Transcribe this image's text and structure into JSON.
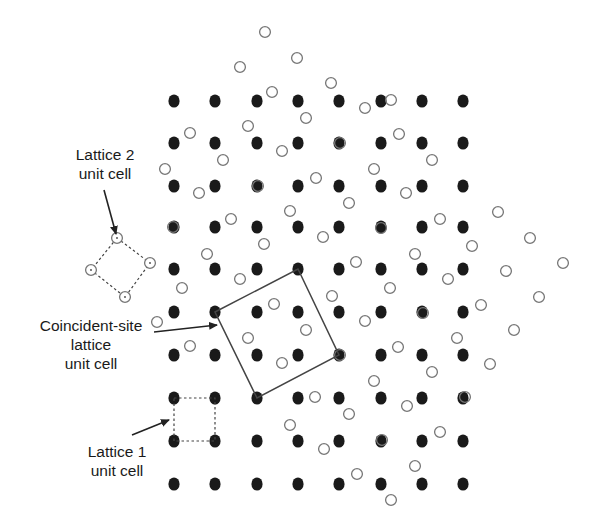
{
  "figure": {
    "labels": {
      "lattice2": {
        "line1": "Lattice 2",
        "line2": "unit cell"
      },
      "csl": {
        "line1": "Coincident-site",
        "line2": "lattice",
        "line3": "unit cell"
      },
      "lattice1": {
        "line1": "Lattice 1",
        "line2": "unit cell"
      }
    },
    "colors": {
      "lattice1_fill": "#1a1a1a",
      "lattice2_stroke": "#777777",
      "lines": "#444444"
    },
    "lattice1": {
      "marker": "filled-circle",
      "columns_x": [
        174,
        215,
        257,
        298,
        339,
        381,
        422,
        463
      ],
      "rows_y": [
        101,
        143,
        186,
        227,
        269,
        312,
        355,
        398,
        441,
        484
      ]
    },
    "lattice2": {
      "marker": "open-circle",
      "points": [
        [
          265,
          32
        ],
        [
          240,
          67
        ],
        [
          297,
          58
        ],
        [
          331,
          83
        ],
        [
          272,
          92
        ],
        [
          365,
          108
        ],
        [
          391,
          100
        ],
        [
          190,
          133
        ],
        [
          248,
          126
        ],
        [
          306,
          118
        ],
        [
          165,
          169
        ],
        [
          223,
          160
        ],
        [
          282,
          151
        ],
        [
          340,
          143
        ],
        [
          399,
          134
        ],
        [
          199,
          193
        ],
        [
          258,
          186
        ],
        [
          316,
          178
        ],
        [
          374,
          169
        ],
        [
          432,
          160
        ],
        [
          173,
          227
        ],
        [
          231,
          219
        ],
        [
          290,
          211
        ],
        [
          349,
          203
        ],
        [
          406,
          193
        ],
        [
          498,
          212
        ],
        [
          207,
          254
        ],
        [
          264,
          244
        ],
        [
          323,
          237
        ],
        [
          381,
          228
        ],
        [
          440,
          219
        ],
        [
          530,
          238
        ],
        [
          182,
          288
        ],
        [
          240,
          279
        ],
        [
          356,
          262
        ],
        [
          415,
          254
        ],
        [
          472,
          246
        ],
        [
          563,
          263
        ],
        [
          157,
          322
        ],
        [
          274,
          304
        ],
        [
          332,
          296
        ],
        [
          390,
          288
        ],
        [
          448,
          279
        ],
        [
          506,
          271
        ],
        [
          539,
          297
        ],
        [
          190,
          346
        ],
        [
          248,
          338
        ],
        [
          306,
          330
        ],
        [
          365,
          321
        ],
        [
          423,
          313
        ],
        [
          481,
          305
        ],
        [
          514,
          330
        ],
        [
          282,
          363
        ],
        [
          340,
          355
        ],
        [
          398,
          347
        ],
        [
          457,
          338
        ],
        [
          290,
          425
        ],
        [
          315,
          397
        ],
        [
          374,
          381
        ],
        [
          432,
          372
        ],
        [
          490,
          364
        ],
        [
          349,
          414
        ],
        [
          407,
          406
        ],
        [
          465,
          397
        ],
        [
          324,
          449
        ],
        [
          382,
          440
        ],
        [
          440,
          432
        ],
        [
          357,
          474
        ],
        [
          415,
          466
        ],
        [
          391,
          500
        ]
      ]
    },
    "lattice2_unit_cell": [
      [
        117,
        238
      ],
      [
        150,
        263
      ],
      [
        125,
        297
      ],
      [
        91,
        270
      ]
    ],
    "lattice1_unit_cell": [
      [
        174,
        398
      ],
      [
        215,
        398
      ],
      [
        215,
        441
      ],
      [
        174,
        441
      ]
    ],
    "csl_unit_cell": [
      [
        215,
        312
      ],
      [
        298,
        269
      ],
      [
        339,
        355
      ],
      [
        257,
        398
      ]
    ],
    "arrows": {
      "lattice2": {
        "from": [
          104,
          190
        ],
        "to": [
          116,
          234
        ]
      },
      "csl": {
        "from": [
          154,
          332
        ],
        "to": [
          217,
          325
        ]
      },
      "lattice1": {
        "from": [
          132,
          435
        ],
        "to": [
          169,
          420
        ]
      }
    }
  }
}
